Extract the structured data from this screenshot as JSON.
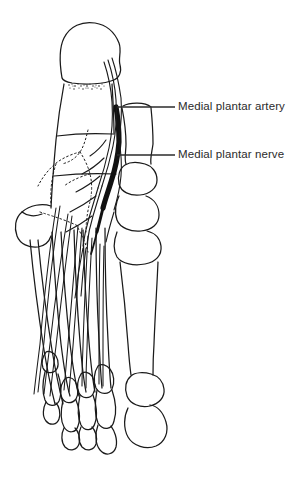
{
  "figure": {
    "background_color": "#ffffff",
    "ink_color": "#1a1a1a",
    "width": 303,
    "height": 479
  },
  "labels": [
    {
      "id": "medial-plantar-artery",
      "text": "Medial plantar artery",
      "text_x": 178,
      "text_y": 100,
      "leader": {
        "x1": 117,
        "y1": 107,
        "x2": 175,
        "y2": 107
      },
      "color": "#2b2b2b"
    },
    {
      "id": "medial-plantar-nerve",
      "text": "Medial plantar nerve",
      "text_x": 178,
      "text_y": 148,
      "leader": {
        "x1": 117,
        "y1": 155,
        "x2": 175,
        "y2": 155
      },
      "color": "#2b2b2b"
    }
  ],
  "structures": {
    "artery_fill": "#111111",
    "bone_outline": "#1a1a1a",
    "hidden_line_style": "dotted",
    "cut_surface": "stippled"
  }
}
